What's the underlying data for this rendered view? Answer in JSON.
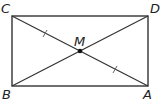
{
  "diagram": {
    "points": {
      "C": {
        "label": "C",
        "x": 12,
        "y": 16
      },
      "D": {
        "label": "D",
        "x": 148,
        "y": 16
      },
      "B": {
        "label": "B",
        "x": 12,
        "y": 86
      },
      "A": {
        "label": "A",
        "x": 148,
        "y": 86
      },
      "M": {
        "label": "M",
        "x": 80,
        "y": 51
      }
    },
    "shape": "rectangle",
    "diagonals": [
      "CA",
      "BD"
    ],
    "congruence_marks": [
      "CM",
      "MA"
    ],
    "stroke_color": "#333333"
  }
}
